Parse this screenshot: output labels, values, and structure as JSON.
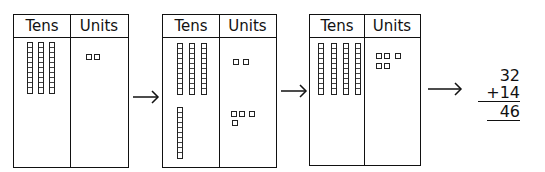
{
  "columns": {
    "tens": "Tens",
    "units": "Units"
  },
  "steps": [
    {
      "label": "32",
      "tens_rods": [
        3
      ],
      "unit_groups": [
        [
          2
        ]
      ]
    },
    {
      "label": "32 and 14 placed",
      "tens_rods": [
        3,
        1
      ],
      "unit_groups": [
        [
          2
        ],
        [
          3,
          1
        ]
      ]
    },
    {
      "label": "combined",
      "tens_rods": [
        4
      ],
      "unit_groups": [
        [
          3,
          2
        ]
      ]
    }
  ],
  "calculation": {
    "addend1": "32",
    "addend2": "+14",
    "result": "46"
  },
  "arrow_symbol": "→"
}
